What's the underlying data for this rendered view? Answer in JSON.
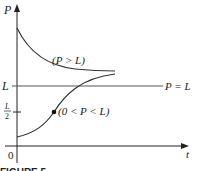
{
  "diagram": {
    "y_axis_label": "P",
    "x_axis_label": "t",
    "origin_label": "0",
    "level_L_label": "L",
    "half_L_numerator": "L",
    "half_L_denominator": "2",
    "equilibrium_label": "P = L",
    "upper_curve_label": "(P > L)",
    "lower_curve_label": "(0 < P < L)",
    "figure_caption": "FIGURE 5",
    "colors": {
      "curve": "#333333",
      "axis": "#222222",
      "equilibrium_line": "#555555",
      "background": "#ffffff"
    }
  }
}
